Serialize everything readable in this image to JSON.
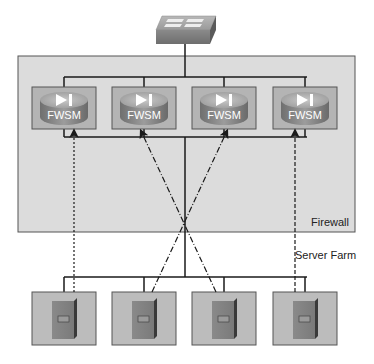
{
  "diagram": {
    "zones": {
      "firewall_label": "Firewall",
      "server_farm_label": "Server Farm"
    },
    "top_device": {
      "type": "switch",
      "icon": "switch-icon"
    },
    "firewall_modules": [
      {
        "label": "FWSM",
        "icon": "firewall-module-icon"
      },
      {
        "label": "FWSM",
        "icon": "firewall-module-icon"
      },
      {
        "label": "FWSM",
        "icon": "firewall-module-icon"
      },
      {
        "label": "FWSM",
        "icon": "firewall-module-icon"
      }
    ],
    "servers": [
      {
        "icon": "server-icon"
      },
      {
        "icon": "server-icon"
      },
      {
        "icon": "server-icon"
      },
      {
        "icon": "server-icon"
      }
    ],
    "flows": [
      {
        "from_server": 1,
        "to_module": 1,
        "style": "dotted"
      },
      {
        "from_server": 2,
        "to_module": 3,
        "style": "dash-dot"
      },
      {
        "from_server": 3,
        "to_module": 2,
        "style": "dash-dot"
      },
      {
        "from_server": 4,
        "to_module": 4,
        "style": "dashed"
      }
    ],
    "colors": {
      "firewall_zone": "#dcdcdc",
      "module_box": "#b4b4b4",
      "server_box": "#bcbcbc",
      "line": "#1a1a1a"
    }
  }
}
